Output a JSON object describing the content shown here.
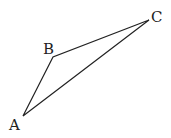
{
  "diagram": {
    "type": "triangle",
    "vertices": [
      {
        "label": "A",
        "x": 23,
        "y": 116,
        "label_x": 9,
        "label_y": 130
      },
      {
        "label": "B",
        "x": 53,
        "y": 57,
        "label_x": 43,
        "label_y": 54
      },
      {
        "label": "C",
        "x": 149,
        "y": 20,
        "label_x": 151,
        "label_y": 22
      }
    ],
    "edges": [
      [
        "A",
        "B"
      ],
      [
        "B",
        "C"
      ],
      [
        "C",
        "A"
      ]
    ],
    "stroke_color": "#222222"
  }
}
